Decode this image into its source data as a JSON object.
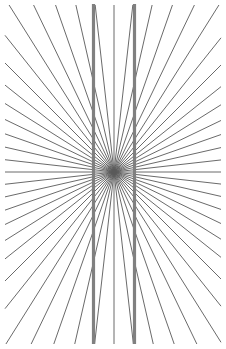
{
  "figure": {
    "name": "Hering illusion",
    "type": "optical-illusion-figure",
    "canvas": {
      "width": 226,
      "height": 349,
      "background_color": "#ffffff",
      "margin": 5
    },
    "radial_pattern": {
      "description": "Fan of straight rays radiating from a single central vanishing point, spanning the full frame",
      "center_x": 114,
      "center_y": 172,
      "ray_count": 56,
      "angle_step_degrees": 6.4285714,
      "angle_start_degrees": 0,
      "color": "#595959",
      "stroke_width": 0.9,
      "ray_length": 520
    },
    "vertical_lines": [
      {
        "name": "left-vertical-line",
        "x": 93.5,
        "y_top": 4,
        "y_bottom": 344,
        "color": "#808080",
        "stroke_width": 3.2
      },
      {
        "name": "right-vertical-line",
        "x": 134.5,
        "y_top": 4,
        "y_bottom": 344,
        "color": "#808080",
        "stroke_width": 3.2
      }
    ]
  },
  "chart_data": {
    "type": "scatter",
    "title": "Hering illusion",
    "subtitle": "",
    "xlabel": "",
    "ylabel": "",
    "xlim": [
      0,
      226
    ],
    "ylim": [
      0,
      349
    ],
    "grid": false,
    "legend": "none",
    "annotations": [],
    "series": [
      {
        "name": "radial rays",
        "count": 56,
        "origin": [
          114,
          172
        ],
        "angles_degrees": [
          0,
          6.43,
          12.86,
          19.29,
          25.71,
          32.14,
          38.57,
          45,
          51.43,
          57.86,
          64.29,
          70.71,
          77.14,
          83.57,
          90,
          96.43,
          102.86,
          109.29,
          115.71,
          122.14,
          128.57,
          135,
          141.43,
          147.86,
          154.29,
          160.71,
          167.14,
          173.57,
          180,
          186.43,
          192.86,
          199.29,
          205.71,
          212.14,
          218.57,
          225,
          231.43,
          237.86,
          244.29,
          250.71,
          257.14,
          263.57,
          270,
          276.43,
          282.86,
          289.29,
          295.71,
          302.14,
          308.57,
          315,
          321.43,
          327.86,
          334.29,
          340.71,
          347.14,
          353.57
        ],
        "color": "#595959"
      },
      {
        "name": "vertical parallel lines",
        "count": 2,
        "x_positions": [
          93.5,
          134.5
        ],
        "y_extent": [
          4,
          344
        ],
        "color": "#808080"
      }
    ]
  }
}
